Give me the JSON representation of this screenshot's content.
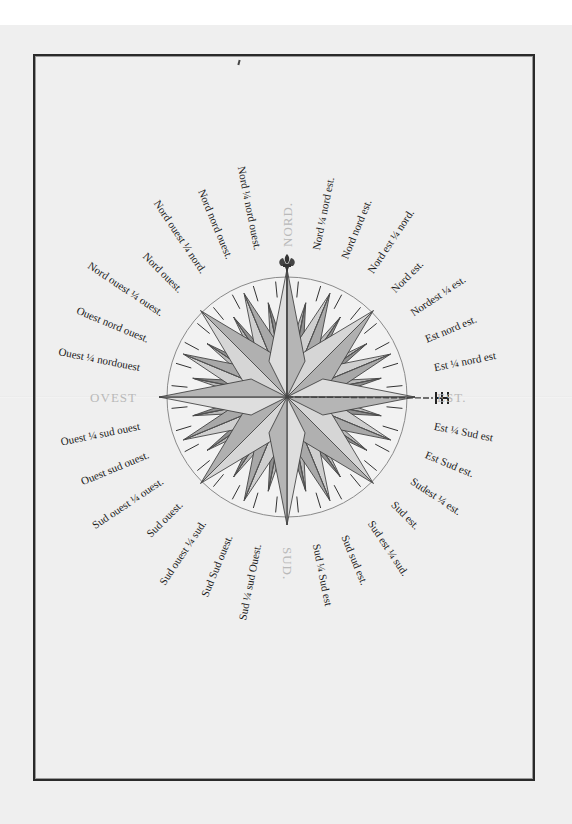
{
  "document": {
    "type": "manuscript compass rose (rose des vents)",
    "language": "French",
    "center": {
      "x": 287,
      "y": 397
    },
    "ring_radius": 120,
    "colors": {
      "paper": "#efefef",
      "ink": "#1c1c1c",
      "cardinal_ink": "#b9b9b9",
      "rose_fill": "#c8c8c8",
      "rose_shadow": "#8a8a8a"
    }
  },
  "cardinals": {
    "north": "NORD.",
    "east": "EST.",
    "south": "SUD.",
    "west": "OVEST"
  },
  "points": [
    {
      "bearing": 11.25,
      "label": "Nord ¼ nord est."
    },
    {
      "bearing": 22.5,
      "label": "Nord nord est."
    },
    {
      "bearing": 33.75,
      "label": "Nord est ¼ nord."
    },
    {
      "bearing": 45,
      "label": "Nord est."
    },
    {
      "bearing": 56.25,
      "label": "Nordest ¼ est."
    },
    {
      "bearing": 67.5,
      "label": "Est nord est."
    },
    {
      "bearing": 78.75,
      "label": "Est ¼ nord est"
    },
    {
      "bearing": 101.25,
      "label": "Est ¼ Sud est"
    },
    {
      "bearing": 112.5,
      "label": "Est Sud est."
    },
    {
      "bearing": 123.75,
      "label": "Sudest ¼ est."
    },
    {
      "bearing": 135,
      "label": "Sud est."
    },
    {
      "bearing": 146.25,
      "label": "Sud est ¼ sud."
    },
    {
      "bearing": 157.5,
      "label": "Sud sud est."
    },
    {
      "bearing": 168.75,
      "label": "Sud ¼ Sud est"
    },
    {
      "bearing": 191.25,
      "label": "Sud ¼ sud Ouest."
    },
    {
      "bearing": 202.5,
      "label": "Sud Sud ouest."
    },
    {
      "bearing": 213.75,
      "label": "Sud ouest ¼ sud."
    },
    {
      "bearing": 225,
      "label": "Sud ouest."
    },
    {
      "bearing": 236.25,
      "label": "Sud ouest ¼ ouest."
    },
    {
      "bearing": 247.5,
      "label": "Ouest sud ouest."
    },
    {
      "bearing": 258.75,
      "label": "Ouest ¼ sud ouest"
    },
    {
      "bearing": 281.25,
      "label": "Ouest ¼ nordouest"
    },
    {
      "bearing": 292.5,
      "label": "Ouest nord ouest."
    },
    {
      "bearing": 303.75,
      "label": "Nord ouest ¼ ouest."
    },
    {
      "bearing": 315,
      "label": "Nord ouest."
    },
    {
      "bearing": 326.25,
      "label": "Nord ouest ¼ nord."
    },
    {
      "bearing": 337.5,
      "label": "Nord nord ouest."
    },
    {
      "bearing": 348.75,
      "label": "Nord ¼ nord ouest."
    }
  ]
}
